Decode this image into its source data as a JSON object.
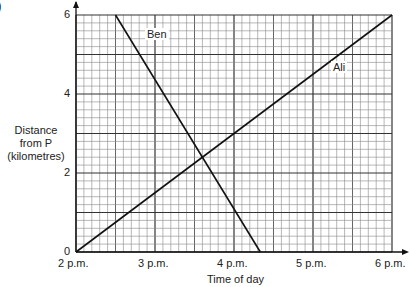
{
  "corner_label": ")",
  "chart_data": {
    "type": "line",
    "title": "",
    "xlabel": "Time of day",
    "ylabel": "Distance from P (kilometres)",
    "ylabel_lines": [
      "Distance",
      "from P",
      "(kilometres)"
    ],
    "x_ticks": [
      "2 p.m.",
      "3 p.m.",
      "4 p.m.",
      "5 p.m.",
      "6 p.m."
    ],
    "y_ticks": [
      "0",
      "2",
      "4",
      "6"
    ],
    "xlim_hours": [
      14,
      18
    ],
    "ylim": [
      0,
      6
    ],
    "grid": true,
    "grid_minor": {
      "x_step_minutes": 6,
      "y_step_km": 0.2
    },
    "series": [
      {
        "name": "Ben",
        "points": [
          {
            "time": "2:30 p.m.",
            "t": 14.5,
            "distance": 6
          },
          {
            "time": "4:20 p.m.",
            "t": 16.333,
            "distance": 0
          }
        ]
      },
      {
        "name": "Ali",
        "points": [
          {
            "time": "2 p.m.",
            "t": 14,
            "distance": 0
          },
          {
            "time": "6 p.m.",
            "t": 18,
            "distance": 6
          }
        ]
      }
    ]
  }
}
